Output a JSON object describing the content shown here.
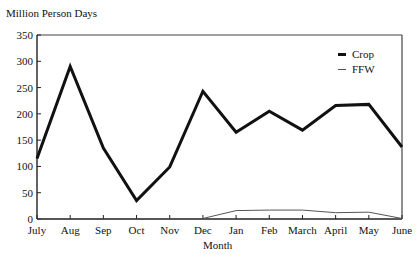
{
  "chart_data": {
    "type": "line",
    "title": "",
    "ylabel": "Million Person Days",
    "xlabel": "Month",
    "ylim": [
      0,
      350
    ],
    "yticks": [
      0,
      50,
      100,
      150,
      200,
      250,
      300,
      350
    ],
    "categories": [
      "July",
      "Aug",
      "Sep",
      "Oct",
      "Nov",
      "Dec",
      "Jan",
      "Feb",
      "March",
      "April",
      "May",
      "June"
    ],
    "series": [
      {
        "name": "Crop",
        "values": [
          115,
          290,
          135,
          35,
          99,
          243,
          165,
          205,
          169,
          216,
          218,
          137
        ],
        "color": "#111111",
        "width": 3
      },
      {
        "name": "FFW",
        "values": [
          0,
          0,
          0,
          0,
          0,
          1,
          16,
          17,
          17,
          12,
          13,
          1
        ],
        "color": "#555555",
        "width": 1
      }
    ],
    "legend_position": "upper right inside",
    "grid": false
  },
  "labels": {
    "ytitle": "Million Person Days",
    "xtitle": "Month",
    "legend": [
      "Crop",
      "FFW"
    ]
  }
}
